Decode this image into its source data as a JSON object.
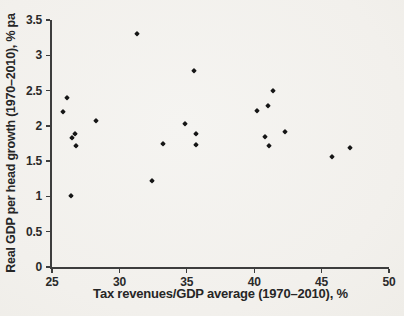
{
  "colors": {
    "background": "#f3f1ed",
    "marker": "#161616",
    "axis": "#3d3d3d",
    "text": "#2a2a2a"
  },
  "chart_data": {
    "type": "scatter",
    "xlabel": "Tax revenues/GDP average (1970–2010), %",
    "ylabel": "Real GDP per head growth (1970–2010), % pa",
    "xlim": [
      25,
      50
    ],
    "ylim": [
      0,
      3.5
    ],
    "x_ticks": [
      25,
      30,
      35,
      40,
      45,
      50
    ],
    "y_ticks": [
      0,
      0.5,
      1,
      1.5,
      2,
      2.5,
      3,
      3.5
    ],
    "grid": false,
    "legend": "none",
    "marker": "diamond",
    "points": [
      [
        25.8,
        2.19
      ],
      [
        26.1,
        2.4
      ],
      [
        26.4,
        1.0
      ],
      [
        26.5,
        1.83
      ],
      [
        26.7,
        1.88
      ],
      [
        26.8,
        1.71
      ],
      [
        28.3,
        2.07
      ],
      [
        31.3,
        3.3
      ],
      [
        32.4,
        1.22
      ],
      [
        33.2,
        1.75
      ],
      [
        34.9,
        2.02
      ],
      [
        35.5,
        2.78
      ],
      [
        35.7,
        1.88
      ],
      [
        35.7,
        1.73
      ],
      [
        40.2,
        2.21
      ],
      [
        40.8,
        1.84
      ],
      [
        41.0,
        2.28
      ],
      [
        41.1,
        1.71
      ],
      [
        41.4,
        2.5
      ],
      [
        42.3,
        1.92
      ],
      [
        45.8,
        1.56
      ],
      [
        47.1,
        1.69
      ]
    ]
  }
}
